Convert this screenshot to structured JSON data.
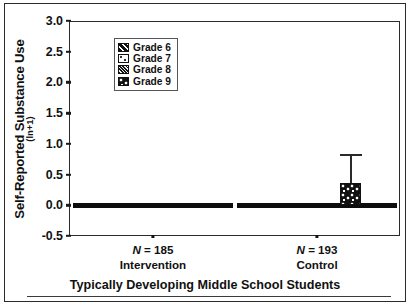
{
  "chart_data": {
    "type": "bar",
    "title": "",
    "caption": "Typically Developing Middle School Students",
    "ylabel": "Self-Reported Substance Use",
    "ylabel_sub": "(ln+1)",
    "xlabel": "",
    "ylim": [
      -0.5,
      3.0
    ],
    "ytick_labels": [
      "3.0",
      "2.5",
      "2.0",
      "1.5",
      "1.0",
      "0.5",
      "0.0",
      "-0.5"
    ],
    "ytick_values": [
      3.0,
      2.5,
      2.0,
      1.5,
      1.0,
      0.5,
      0.0,
      -0.5
    ],
    "grid": false,
    "legend_position": "upper-left-inside",
    "categories": [
      "Intervention",
      "Control"
    ],
    "group_n_labels": [
      "N = 185",
      "N = 193"
    ],
    "group_n_values": [
      185,
      193
    ],
    "series": [
      {
        "name": "Grade 6",
        "pattern": "diagonal-stripe",
        "values": [
          0.0,
          0.0
        ],
        "errors": [
          0.0,
          0.0
        ]
      },
      {
        "name": "Grade 7",
        "pattern": "light-speckle",
        "values": [
          0.0,
          0.0
        ],
        "errors": [
          0.0,
          0.0
        ]
      },
      {
        "name": "Grade 8",
        "pattern": "dense-hatch",
        "values": [
          0.0,
          0.0
        ],
        "errors": [
          0.0,
          0.0
        ]
      },
      {
        "name": "Grade 9",
        "pattern": "coarse-checker",
        "values": [
          0.0,
          0.37
        ],
        "errors": [
          0.0,
          0.46
        ]
      }
    ]
  },
  "legend": {
    "items": [
      {
        "label": "Grade 6"
      },
      {
        "label": "Grade 7"
      },
      {
        "label": "Grade 8"
      },
      {
        "label": "Grade 9"
      }
    ]
  }
}
